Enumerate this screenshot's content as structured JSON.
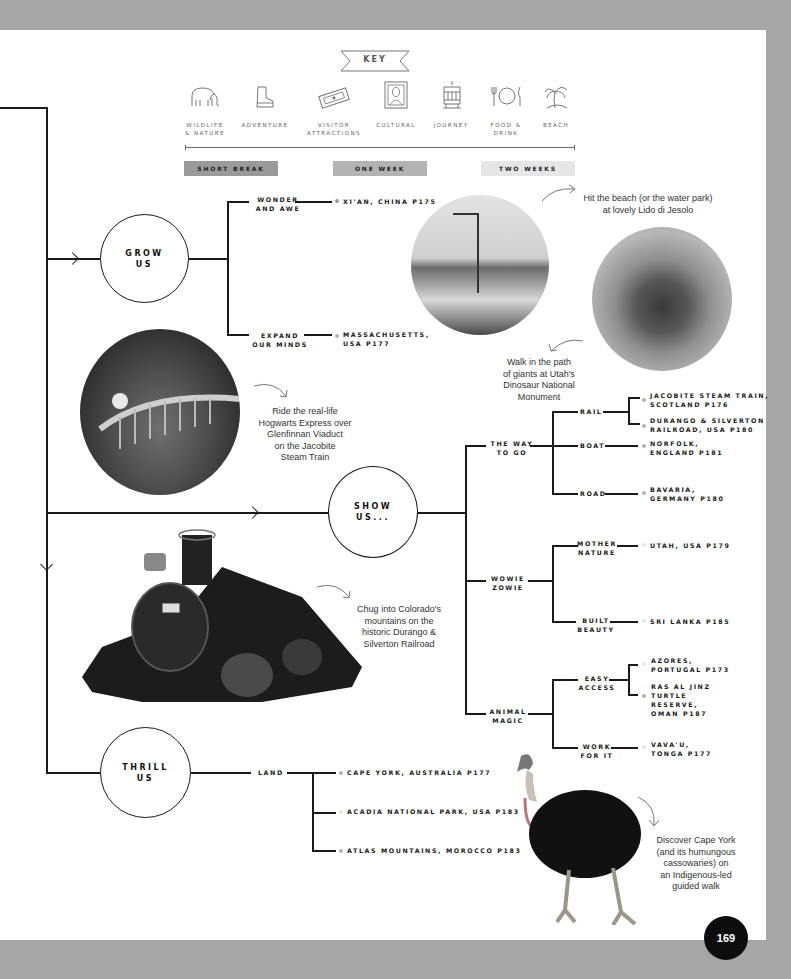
{
  "key": {
    "title": "KEY",
    "categories": [
      {
        "label": "WILDLIFE\n& NATURE",
        "icon": "elephant-icon"
      },
      {
        "label": "ADVENTURE",
        "icon": "boot-icon"
      },
      {
        "label": "VISITOR\nATTRACTIONS",
        "icon": "ticket-icon"
      },
      {
        "label": "CULTURAL",
        "icon": "framed-portrait-icon"
      },
      {
        "label": "JOURNEY",
        "icon": "tram-icon"
      },
      {
        "label": "FOOD &\nDRINK",
        "icon": "plate-cutlery-icon"
      },
      {
        "label": "BEACH",
        "icon": "palm-tree-icon"
      }
    ],
    "durations": [
      {
        "label": "SHORT BREAK",
        "color": "#9a9a9a"
      },
      {
        "label": "ONE WEEK",
        "color": "#b3b3b3"
      },
      {
        "label": "TWO WEEKS",
        "color": "#e6e6e6"
      }
    ]
  },
  "tree": {
    "grow": {
      "label": "GROW\nUS",
      "branches": [
        {
          "label": "WONDER\nAND AWE",
          "dest": "XI'AN, CHINA P175"
        },
        {
          "label": "EXPAND\nOUR MINDS",
          "dest": "MASSACHUSETTS,\nUSA P177"
        }
      ]
    },
    "show": {
      "label": "SHOW\nUS...",
      "groups": [
        {
          "label": "THE WAY\nTO GO",
          "branches": [
            {
              "label": "RAIL",
              "dests": [
                "JACOBITE STEAM TRAIN,\nSCOTLAND P176",
                "DURANGO & SILVERTON\nRAILROAD, USA P180"
              ]
            },
            {
              "label": "BOAT",
              "dests": [
                "NORFOLK,\nENGLAND P181"
              ]
            },
            {
              "label": "ROAD",
              "dests": [
                "BAVARIA,\nGERMANY P180"
              ]
            }
          ]
        },
        {
          "label": "WOWIE\nZOWIE",
          "branches": [
            {
              "label": "MOTHER\nNATURE",
              "dests": [
                "UTAH, USA P179"
              ]
            },
            {
              "label": "BUILT\nBEAUTY",
              "dests": [
                "SRI LANKA P185"
              ]
            }
          ]
        },
        {
          "label": "ANIMAL\nMAGIC",
          "branches": [
            {
              "label": "EASY\nACCESS",
              "dests": [
                "AZORES,\nPORTUGAL P173",
                "RAS AL JINZ\nTURTLE\nRESERVE,\nOMAN P187"
              ]
            },
            {
              "label": "WORK\nFOR IT",
              "dests": [
                "VAVA'U,\nTONGA P177"
              ]
            }
          ]
        }
      ]
    },
    "thrill": {
      "label": "THRILL\nUS",
      "branches": [
        {
          "label": "LAND",
          "dests": [
            "CAPE YORK, AUSTRALIA P177",
            "ACADIA NATIONAL PARK, USA P183",
            "ATLAS MOUNTAINS, MOROCCO P183"
          ]
        }
      ]
    }
  },
  "notes": {
    "lido": "Hit the beach (or the water park)\nat lovely Lido di Jesolo",
    "dinosaur": "Walk in the path\nof giants at Utah's\nDinosaur National\nMonument",
    "jacobite": "Ride the real-life\nHogwarts Express over\nGlenfinnan Viaduct\non the Jacobite\nSteam Train",
    "durango": "Chug into Colorado's\nmountains on the\nhistoric Durango &\nSilverton Railroad",
    "capeyork": "Discover Cape York\n(and its humungous\ncassowaries) on\nan Indigenous-led\nguided walk"
  },
  "page_number": "169"
}
